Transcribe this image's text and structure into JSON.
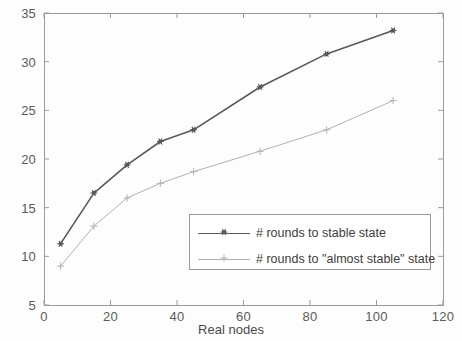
{
  "chart_data": {
    "type": "line",
    "title": "",
    "xlabel": "Real nodes",
    "ylabel": "",
    "xlim": [
      0,
      120
    ],
    "ylim": [
      5,
      35
    ],
    "xticks": [
      0,
      20,
      40,
      60,
      80,
      100,
      120
    ],
    "yticks": [
      5,
      10,
      15,
      20,
      25,
      30,
      35
    ],
    "xtick_labels": [
      "0",
      "20",
      "40",
      "60",
      "80",
      "100",
      "120"
    ],
    "ytick_labels": [
      "5",
      "10",
      "15",
      "20",
      "25",
      "30",
      "35"
    ],
    "grid": false,
    "legend_position": "lower right",
    "x": [
      5,
      15,
      25,
      35,
      45,
      65,
      85,
      105
    ],
    "series": [
      {
        "name": "# rounds to stable state",
        "values": [
          11.3,
          16.5,
          19.4,
          21.8,
          23.0,
          27.4,
          30.8,
          33.2
        ],
        "color": "#595959",
        "marker": "asterisk-marker",
        "line_width": 1.6
      },
      {
        "name": "# rounds to \"almost stable\" state",
        "values": [
          9.0,
          13.1,
          16.0,
          17.5,
          18.7,
          20.8,
          23.0,
          26.0
        ],
        "color": "#b2b2b2",
        "marker": "plus-marker",
        "line_width": 1.0
      }
    ]
  },
  "axes": {
    "frame_color": "#9a9a9a"
  }
}
